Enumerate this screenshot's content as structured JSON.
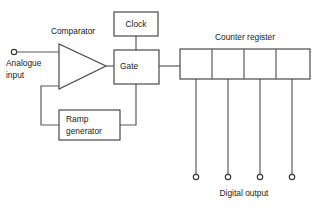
{
  "diagram": {
    "background_color": "#ffffff",
    "line_color": "#5a5a5a",
    "text_color": "#1b1b1b",
    "labels": {
      "comparator": "Comparator",
      "clock": "Clock",
      "gate": "Gate",
      "counter_register": "Counter register",
      "ramp_line1": "Ramp",
      "ramp_line2": "generator",
      "analogue_line1": "Analogue",
      "analogue_line2": "input",
      "digital_output": "Digital output"
    },
    "blocks": [
      {
        "name": "comparator",
        "shape": "triangle",
        "label": "Comparator"
      },
      {
        "name": "clock",
        "shape": "rect",
        "label": "Clock"
      },
      {
        "name": "gate",
        "shape": "rect",
        "label": "Gate"
      },
      {
        "name": "ramp-generator",
        "shape": "rect",
        "label": "Ramp generator"
      },
      {
        "name": "counter-register",
        "shape": "rect-4-cells",
        "label": "Counter register",
        "cells": 4
      }
    ],
    "terminals": {
      "input_count": 1,
      "output_count": 4
    }
  }
}
